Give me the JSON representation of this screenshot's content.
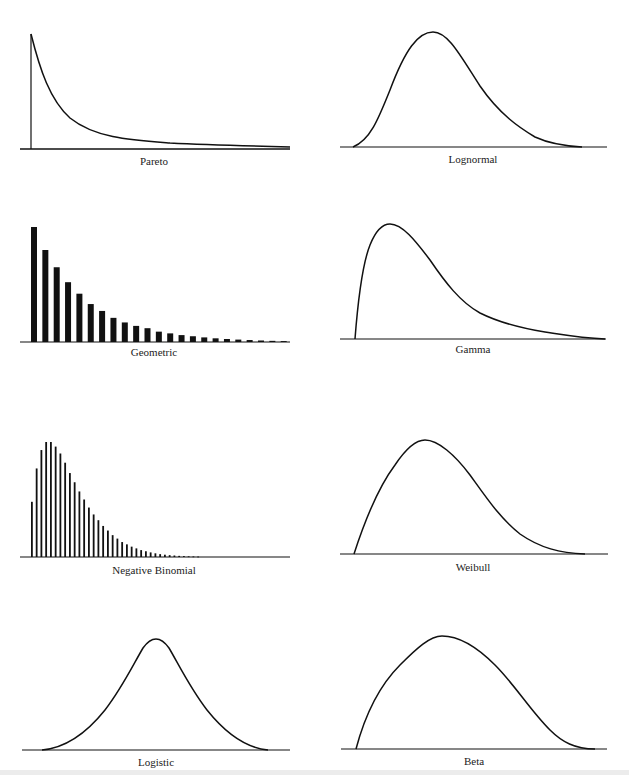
{
  "figure": {
    "panels": [
      {
        "id": "pareto",
        "label": "Pareto",
        "kind": "continuous"
      },
      {
        "id": "lognormal",
        "label": "Lognormal",
        "kind": "continuous"
      },
      {
        "id": "geometric",
        "label": "Geometric",
        "kind": "discrete"
      },
      {
        "id": "gamma",
        "label": "Gamma",
        "kind": "continuous"
      },
      {
        "id": "negbinomial",
        "label": "Negative Binomial",
        "kind": "discrete"
      },
      {
        "id": "weibull",
        "label": "Weibull",
        "kind": "continuous"
      },
      {
        "id": "logistic",
        "label": "Logistic",
        "kind": "continuous"
      },
      {
        "id": "beta",
        "label": "Beta",
        "kind": "continuous"
      }
    ]
  },
  "colors": {
    "ink": "#111111",
    "background": "#ffffff",
    "band": "#ececec"
  },
  "chart_data": [
    {
      "type": "line",
      "title": "Pareto",
      "xlabel": "",
      "ylabel": "",
      "grid": false,
      "legend": "none",
      "x": [
        0,
        0.05,
        0.1,
        0.15,
        0.2,
        0.3,
        0.4,
        0.5,
        0.6,
        0.7,
        0.8,
        0.9,
        1.0
      ],
      "values": [
        1.0,
        0.62,
        0.42,
        0.3,
        0.22,
        0.13,
        0.09,
        0.065,
        0.05,
        0.04,
        0.03,
        0.02,
        0.015
      ],
      "note": "Shape sketch only; no axis ticks shown. Vertical line at x=0 marks support start."
    },
    {
      "type": "line",
      "title": "Lognormal",
      "xlabel": "",
      "ylabel": "",
      "grid": false,
      "legend": "none",
      "x": [
        0,
        0.1,
        0.2,
        0.3,
        0.35,
        0.4,
        0.5,
        0.6,
        0.7,
        0.8,
        0.9,
        1.0
      ],
      "values": [
        0,
        0.12,
        0.55,
        0.93,
        1.0,
        0.96,
        0.74,
        0.47,
        0.24,
        0.1,
        0.03,
        0.0
      ]
    },
    {
      "type": "bar",
      "title": "Geometric",
      "xlabel": "",
      "ylabel": "",
      "grid": false,
      "legend": "none",
      "categories": [
        1,
        2,
        3,
        4,
        5,
        6,
        7,
        8,
        9,
        10,
        11,
        12,
        13,
        14,
        15,
        16,
        17,
        18,
        19,
        20,
        21,
        22,
        23
      ],
      "values": [
        1.0,
        0.8,
        0.65,
        0.52,
        0.42,
        0.33,
        0.27,
        0.21,
        0.17,
        0.14,
        0.12,
        0.09,
        0.075,
        0.06,
        0.05,
        0.04,
        0.032,
        0.026,
        0.021,
        0.017,
        0.013,
        0.01,
        0.008
      ]
    },
    {
      "type": "line",
      "title": "Gamma",
      "xlabel": "",
      "ylabel": "",
      "grid": false,
      "legend": "none",
      "x": [
        0,
        0.05,
        0.1,
        0.15,
        0.2,
        0.3,
        0.4,
        0.5,
        0.6,
        0.7,
        0.8,
        0.9,
        1.0
      ],
      "values": [
        0,
        0.7,
        0.96,
        1.0,
        0.95,
        0.75,
        0.5,
        0.3,
        0.16,
        0.09,
        0.05,
        0.02,
        0.0
      ]
    },
    {
      "type": "bar",
      "title": "Negative Binomial",
      "xlabel": "",
      "ylabel": "",
      "grid": false,
      "legend": "none",
      "categories": [
        0,
        1,
        2,
        3,
        4,
        5,
        6,
        7,
        8,
        9,
        10,
        11,
        12,
        13,
        14,
        15,
        16,
        17,
        18,
        19,
        20,
        21,
        22,
        23,
        24,
        25,
        26,
        27,
        28,
        29,
        30,
        31,
        32,
        33,
        34,
        35
      ],
      "values": [
        0.48,
        0.77,
        0.93,
        1.0,
        1.0,
        0.96,
        0.9,
        0.82,
        0.73,
        0.65,
        0.57,
        0.5,
        0.43,
        0.37,
        0.32,
        0.27,
        0.23,
        0.19,
        0.16,
        0.13,
        0.11,
        0.09,
        0.075,
        0.06,
        0.05,
        0.04,
        0.032,
        0.025,
        0.02,
        0.016,
        0.013,
        0.01,
        0.008,
        0.006,
        0.005,
        0.004
      ]
    },
    {
      "type": "line",
      "title": "Weibull",
      "xlabel": "",
      "ylabel": "",
      "grid": false,
      "legend": "none",
      "x": [
        0,
        0.1,
        0.2,
        0.27,
        0.35,
        0.45,
        0.55,
        0.65,
        0.75,
        0.85,
        1.0
      ],
      "values": [
        0,
        0.6,
        0.92,
        1.0,
        0.95,
        0.76,
        0.5,
        0.26,
        0.1,
        0.03,
        0.0
      ]
    },
    {
      "type": "line",
      "title": "Logistic",
      "xlabel": "",
      "ylabel": "",
      "grid": false,
      "legend": "none",
      "x": [
        0,
        0.1,
        0.2,
        0.3,
        0.4,
        0.45,
        0.5,
        0.55,
        0.6,
        0.7,
        0.8,
        0.9,
        1.0
      ],
      "values": [
        0,
        0.02,
        0.1,
        0.3,
        0.7,
        0.92,
        1.0,
        0.92,
        0.7,
        0.3,
        0.1,
        0.02,
        0.0
      ]
    },
    {
      "type": "line",
      "title": "Beta",
      "xlabel": "",
      "ylabel": "",
      "grid": false,
      "legend": "none",
      "x": [
        0,
        0.1,
        0.2,
        0.3,
        0.35,
        0.4,
        0.5,
        0.6,
        0.7,
        0.8,
        0.9,
        1.0
      ],
      "values": [
        0,
        0.5,
        0.82,
        0.98,
        1.0,
        0.99,
        0.9,
        0.72,
        0.5,
        0.27,
        0.08,
        0.0
      ]
    }
  ]
}
